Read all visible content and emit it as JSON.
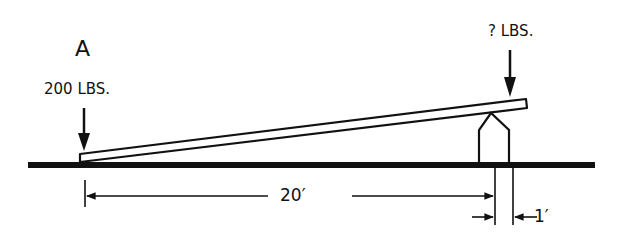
{
  "diagram": {
    "labels": {
      "section": "A",
      "left_load": "200 LBS.",
      "right_load": "? LBS.",
      "long_distance": "20′",
      "short_distance": "1′"
    },
    "elements": [
      "ground-line",
      "lever-bar",
      "fulcrum",
      "left-load-arrow",
      "right-load-arrow",
      "dimension-20ft",
      "dimension-1ft"
    ],
    "colors": {
      "ink": "#111111",
      "background": "#ffffff"
    }
  }
}
